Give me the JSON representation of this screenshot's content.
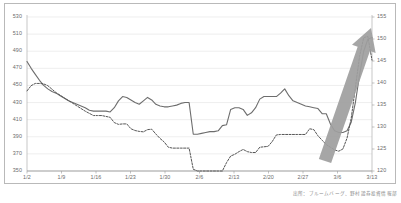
{
  "chart_data": {
    "type": "line",
    "title": "",
    "subtitle": "",
    "xlabel": "",
    "ylabel": "",
    "grid": true,
    "legend_position": "none",
    "caption": "出所：ブルームバーグ、野村證券投資情報部",
    "x_tick_labels": [
      "1/2",
      "1/9",
      "1/16",
      "1/23",
      "1/30",
      "2/6",
      "2/13",
      "2/20",
      "2/27",
      "3/6",
      "3/13"
    ],
    "axes": {
      "left": {
        "ylim": [
          350,
          530
        ],
        "step": 20,
        "tick_labels": [
          "530",
          "510",
          "490",
          "470",
          "450",
          "430",
          "410",
          "390",
          "370",
          "350"
        ]
      },
      "right": {
        "ylim": [
          120,
          155
        ],
        "step": 5,
        "tick_labels": [
          "155",
          "150",
          "145",
          "140",
          "135",
          "130",
          "125",
          "120"
        ]
      }
    },
    "series": [
      {
        "name": "solid-series",
        "axis": "left",
        "style": "solid",
        "color": "#6d6d6d",
        "values": [
          478,
          470,
          463,
          456,
          450,
          446,
          443,
          441,
          438,
          435,
          432,
          430,
          428,
          426,
          424,
          421,
          420,
          420,
          420,
          420,
          419,
          424,
          432,
          437,
          436,
          433,
          430,
          428,
          432,
          436,
          433,
          428,
          426,
          425,
          425,
          426,
          427,
          429,
          430,
          430,
          393,
          393,
          394,
          395,
          396,
          396,
          397,
          403,
          404,
          422,
          424,
          424,
          422,
          415,
          418,
          424,
          434,
          437,
          437,
          437,
          437,
          441,
          446,
          438,
          432,
          430,
          428,
          426,
          425,
          424,
          423,
          417,
          417,
          405,
          397,
          395,
          395,
          397,
          407,
          430,
          462,
          490,
          504,
          506
        ]
      },
      {
        "name": "dashed-series",
        "axis": "right",
        "style": "dashed",
        "color": "#555555",
        "values": [
          138.2,
          139.4,
          139.9,
          139.9,
          139.8,
          139.4,
          138.6,
          137.8,
          137.2,
          136.6,
          136.0,
          135.4,
          134.8,
          134.2,
          133.6,
          133.1,
          132.6,
          132.6,
          132.6,
          132.4,
          132.2,
          131.0,
          130.6,
          130.7,
          130.7,
          129.6,
          129.2,
          129.0,
          128.9,
          129.4,
          129.5,
          128.4,
          127.4,
          126.6,
          125.4,
          125.2,
          125.2,
          125.2,
          125.2,
          125.2,
          120.4,
          120.0,
          120.0,
          120.0,
          120.0,
          120.0,
          120.0,
          120.0,
          121.9,
          123.4,
          123.8,
          124.4,
          124.9,
          124.4,
          124.2,
          124.2,
          125.4,
          125.5,
          125.6,
          126.7,
          128.2,
          128.3,
          128.3,
          128.3,
          128.3,
          128.3,
          128.3,
          128.3,
          129.6,
          129.4,
          128.0,
          127.0,
          126.0,
          125.4,
          124.8,
          124.5,
          125.0,
          127.5,
          132.0,
          139.0,
          146.0,
          150.3,
          150.6,
          145.2
        ]
      }
    ],
    "annotations": [
      {
        "name": "up-trend-arrow",
        "type": "arrow",
        "color": "#9e9e9e",
        "direction": "up-right",
        "from": [
          325,
          161
        ],
        "to": [
          371,
          28
        ]
      }
    ]
  }
}
